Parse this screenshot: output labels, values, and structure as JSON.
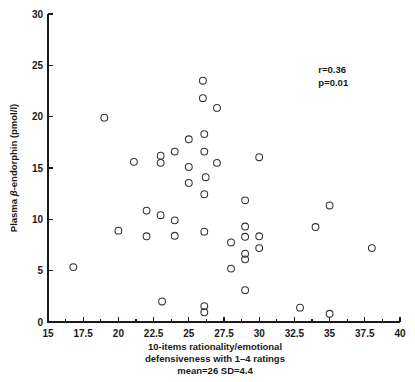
{
  "chart_data": {
    "type": "scatter",
    "title": "",
    "xlabel_lines": [
      "10-items rationality/emotional",
      "defensiveness with 1–4 ratings",
      "mean=26 SD=4.4"
    ],
    "ylabel_prefix": "Plasma ",
    "ylabel_italic": "β",
    "ylabel_suffix": "-endorphin (pmol/l)",
    "ylabel_full": "Plasma β-endorphin (pmol/l)",
    "xlim": [
      15,
      40
    ],
    "ylim": [
      0,
      30
    ],
    "grid": false,
    "legend": "none",
    "xticks": [
      15,
      17.5,
      20,
      22.5,
      25,
      27.5,
      30,
      32.5,
      35,
      37.5,
      40
    ],
    "xtick_labels": [
      "15",
      "17.5",
      "20",
      "22.5",
      "25",
      "27.5",
      "30",
      "32.5",
      "35",
      "37.5",
      "40"
    ],
    "xminorticks": [
      16.25,
      18.75,
      21.25,
      23.75,
      26.25,
      28.75,
      31.25,
      33.75,
      36.25,
      38.75
    ],
    "yticks": [
      0,
      5,
      10,
      15,
      20,
      25,
      30
    ],
    "ytick_labels": [
      "0",
      "5",
      "10",
      "15",
      "20",
      "25",
      "30"
    ],
    "marker": "open-circle",
    "marker_color": "#333333",
    "marker_radius_px": 3.4,
    "annotations": [
      {
        "text": "r=0.36",
        "x": 34.2,
        "y": 24.3
      },
      {
        "text": "p=0.01",
        "x": 34.2,
        "y": 23.0
      }
    ],
    "points": [
      {
        "x": 16.8,
        "y": 5.35
      },
      {
        "x": 19.0,
        "y": 19.9
      },
      {
        "x": 20.0,
        "y": 8.9
      },
      {
        "x": 21.1,
        "y": 15.6
      },
      {
        "x": 22.0,
        "y": 10.85
      },
      {
        "x": 22.0,
        "y": 8.35
      },
      {
        "x": 23.0,
        "y": 16.2
      },
      {
        "x": 23.0,
        "y": 15.5
      },
      {
        "x": 23.0,
        "y": 10.4
      },
      {
        "x": 23.1,
        "y": 2.0
      },
      {
        "x": 24.0,
        "y": 16.6
      },
      {
        "x": 24.0,
        "y": 9.9
      },
      {
        "x": 24.0,
        "y": 8.4
      },
      {
        "x": 25.0,
        "y": 17.8
      },
      {
        "x": 25.0,
        "y": 15.1
      },
      {
        "x": 25.0,
        "y": 13.55
      },
      {
        "x": 26.0,
        "y": 23.5
      },
      {
        "x": 26.0,
        "y": 21.8
      },
      {
        "x": 26.1,
        "y": 18.3
      },
      {
        "x": 26.1,
        "y": 16.6
      },
      {
        "x": 26.2,
        "y": 14.1
      },
      {
        "x": 26.1,
        "y": 12.45
      },
      {
        "x": 26.1,
        "y": 8.8
      },
      {
        "x": 26.1,
        "y": 1.55
      },
      {
        "x": 26.1,
        "y": 0.95
      },
      {
        "x": 27.0,
        "y": 20.85
      },
      {
        "x": 27.0,
        "y": 15.5
      },
      {
        "x": 28.0,
        "y": 7.75
      },
      {
        "x": 28.0,
        "y": 5.2
      },
      {
        "x": 29.0,
        "y": 11.85
      },
      {
        "x": 29.0,
        "y": 9.3
      },
      {
        "x": 29.0,
        "y": 8.3
      },
      {
        "x": 29.0,
        "y": 6.65
      },
      {
        "x": 29.0,
        "y": 6.1
      },
      {
        "x": 29.0,
        "y": 3.1
      },
      {
        "x": 30.0,
        "y": 16.05
      },
      {
        "x": 30.0,
        "y": 8.35
      },
      {
        "x": 30.0,
        "y": 7.2
      },
      {
        "x": 32.9,
        "y": 1.4
      },
      {
        "x": 34.0,
        "y": 9.25
      },
      {
        "x": 35.0,
        "y": 11.35
      },
      {
        "x": 35.0,
        "y": 0.8
      },
      {
        "x": 38.0,
        "y": 7.2
      }
    ]
  },
  "plot_geometry": {
    "left_px": 48,
    "right_px": 400,
    "top_px": 14,
    "bottom_px": 322
  }
}
